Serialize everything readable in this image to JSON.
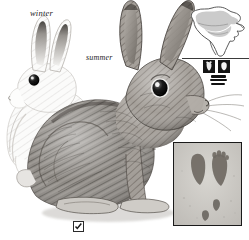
{
  "plate": {
    "title": "Cottontail rabbit field-guide plate",
    "background_color": "#ffffff",
    "ink_color": "#1c1c1c"
  },
  "labels": {
    "winter": "winter",
    "summer": "summer"
  },
  "animals": [
    {
      "id": "winter-rabbit",
      "season_label": "winter",
      "pelage": "white",
      "features": [
        "black ear tips",
        "dark eye",
        "white body"
      ],
      "position": "background-left"
    },
    {
      "id": "summer-rabbit",
      "season_label": "summer",
      "pelage": "brown-grey agouti",
      "features": [
        "long ears",
        "large dark eye",
        "whiskers",
        "dense pencil-hatched fur",
        "seated posture"
      ],
      "position": "foreground-center"
    }
  ],
  "range_map": {
    "name": "north-america-range-map",
    "continent": "North America",
    "shaded_region_label": "range",
    "shade_color": "#c8c8c8",
    "outline_color": "#555555",
    "has_divider_rule": true
  },
  "sign_icons": [
    {
      "name": "hind-track-icon",
      "label": "hind foot track"
    },
    {
      "name": "front-track-icon",
      "label": "front foot track"
    },
    {
      "name": "scat-icon",
      "label": "scat",
      "marks": 3
    }
  ],
  "track_inset": {
    "name": "track-photo-inset",
    "caption": "",
    "background_color": "#c9c7c2",
    "border_color": "#1a1a1a",
    "prints": [
      {
        "type": "hind",
        "side": "left",
        "size": "large"
      },
      {
        "type": "hind",
        "side": "right",
        "size": "large"
      },
      {
        "type": "front",
        "side": "right",
        "size": "small"
      },
      {
        "type": "front",
        "side": "left",
        "size": "small"
      }
    ]
  },
  "checkbox": {
    "name": "species-checkbox",
    "checked": true,
    "label": ""
  }
}
